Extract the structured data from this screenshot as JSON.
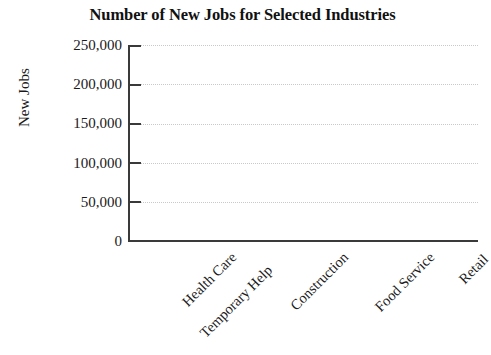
{
  "chart_data": {
    "type": "bar",
    "title": "Number of New Jobs for Selected Industries",
    "xlabel": "",
    "ylabel": "New Jobs",
    "categories": [
      "Health Care",
      "Temporary Help",
      "Construction",
      "Food Service",
      "Retail"
    ],
    "values": [
      null,
      null,
      null,
      null,
      null
    ],
    "series": [
      {
        "name": "New Jobs",
        "values": [
          null,
          null,
          null,
          null,
          null
        ]
      }
    ],
    "ylim": [
      0,
      250000
    ],
    "ytick_labels": [
      "0",
      "50,000",
      "100,000",
      "150,000",
      "200,000",
      "250,000"
    ],
    "ytick_values": [
      0,
      50000,
      100000,
      150000,
      200000,
      250000
    ],
    "grid": true,
    "grid_axis": "y",
    "grid_style": "dotted",
    "legend": "none",
    "note": "Axes template only - no bars plotted",
    "colors": {
      "axis": "#3a3a3a",
      "gridline": "#c9c9c9",
      "text": "#1a1a1a",
      "background": "#ffffff"
    }
  },
  "chart": {
    "title": "Number of New Jobs for Selected Industries",
    "y_axis": {
      "title": "New Jobs",
      "ticks": [
        {
          "label": "250,000",
          "value": 250000
        },
        {
          "label": "200,000",
          "value": 200000
        },
        {
          "label": "150,000",
          "value": 150000
        },
        {
          "label": "100,000",
          "value": 100000
        },
        {
          "label": "50,000",
          "value": 50000
        },
        {
          "label": "0",
          "value": 0
        }
      ]
    },
    "x_axis": {
      "categories": [
        {
          "label": "Health Care"
        },
        {
          "label": "Temporary Help"
        },
        {
          "label": "Construction"
        },
        {
          "label": "Food Service"
        },
        {
          "label": "Retail"
        }
      ]
    }
  }
}
